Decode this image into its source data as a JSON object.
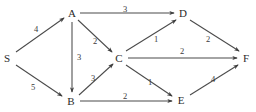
{
  "figure": {
    "type": "directed-weighted-graph",
    "background_color": "#ffffff",
    "line_color": "#4a4a4a",
    "text_color": "#2b2b2b"
  },
  "nodes": [
    {
      "id": "S",
      "label": "S",
      "x": 7,
      "y": 58
    },
    {
      "id": "A",
      "label": "A",
      "x": 72,
      "y": 13
    },
    {
      "id": "B",
      "label": "B",
      "x": 71,
      "y": 101
    },
    {
      "id": "C",
      "label": "C",
      "x": 119,
      "y": 58
    },
    {
      "id": "D",
      "label": "D",
      "x": 183,
      "y": 13
    },
    {
      "id": "E",
      "label": "E",
      "x": 181,
      "y": 100
    },
    {
      "id": "F",
      "label": "F",
      "x": 246,
      "y": 58
    }
  ],
  "edges": [
    {
      "id": "S-A",
      "from": "S",
      "to": "A",
      "weight": "4",
      "label_x": 36,
      "label_y": 29
    },
    {
      "id": "S-B",
      "from": "S",
      "to": "B",
      "weight": "5",
      "label_x": 33,
      "label_y": 87
    },
    {
      "id": "A-D",
      "from": "A",
      "to": "D",
      "weight": "3",
      "label_x": 125,
      "label_y": 9
    },
    {
      "id": "A-C",
      "from": "A",
      "to": "C",
      "weight": "2",
      "label_x": 95,
      "label_y": 41
    },
    {
      "id": "A-B",
      "from": "A",
      "to": "B",
      "weight": "3",
      "label_x": 79,
      "label_y": 57
    },
    {
      "id": "B-C",
      "from": "B",
      "to": "C",
      "weight": "3",
      "label_x": 93,
      "label_y": 78
    },
    {
      "id": "B-E",
      "from": "B",
      "to": "E",
      "weight": "2",
      "label_x": 125,
      "label_y": 96
    },
    {
      "id": "C-D",
      "from": "C",
      "to": "D",
      "weight": "1",
      "label_x": 156,
      "label_y": 39
    },
    {
      "id": "C-F",
      "from": "C",
      "to": "F",
      "weight": "2",
      "label_x": 182,
      "label_y": 51
    },
    {
      "id": "C-E",
      "from": "C",
      "to": "E",
      "weight": "1",
      "label_x": 150,
      "label_y": 82
    },
    {
      "id": "D-F",
      "from": "D",
      "to": "F",
      "weight": "2",
      "label_x": 208,
      "label_y": 39
    },
    {
      "id": "E-F",
      "from": "E",
      "to": "F",
      "weight": "4",
      "label_x": 213,
      "label_y": 79
    }
  ],
  "geometry": {
    "paths": {
      "S-A": "M 16 52 L 64 18",
      "S-B": "M 16 65 L 62 96",
      "A-D": "M 80 13 L 174 13",
      "A-C": "M 78 20 L 112 52",
      "A-B": "M 72 22 L 72 92",
      "B-C": "M 79 95 L 113 64",
      "B-E": "M 80 101 L 172 101",
      "C-D": "M 126 51 L 176 20",
      "C-F": "M 128 58 L 237 58",
      "C-E": "M 126 65 L 172 96",
      "D-F": "M 190 20 L 239 51",
      "E-F": "M 190 95 L 238 65"
    }
  }
}
